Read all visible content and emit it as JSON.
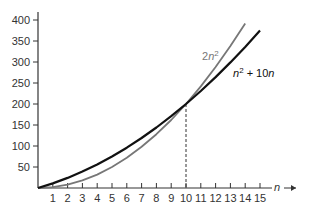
{
  "chart_data": {
    "type": "line",
    "title": "",
    "xlabel": "n",
    "ylabel": "",
    "xlim": [
      0,
      15
    ],
    "ylim": [
      0,
      400
    ],
    "x_ticks": [
      1,
      2,
      3,
      4,
      5,
      6,
      7,
      8,
      9,
      10,
      11,
      12,
      13,
      14,
      15
    ],
    "y_ticks": [
      50,
      100,
      150,
      200,
      250,
      300,
      350,
      400
    ],
    "grid": false,
    "legend": null,
    "series": [
      {
        "name": "2n^2",
        "label": "2n",
        "sup": "2",
        "color": "#777777",
        "x": [
          0,
          1,
          2,
          3,
          4,
          5,
          6,
          7,
          8,
          9,
          10,
          11,
          12,
          13,
          14
        ],
        "values": [
          0,
          2,
          8,
          18,
          32,
          50,
          72,
          98,
          128,
          162,
          200,
          242,
          288,
          338,
          392
        ]
      },
      {
        "name": "n^2 + 10n",
        "label_a": "n",
        "sup": "2",
        "label_b": " + 10n",
        "color": "#111111",
        "x": [
          0,
          1,
          2,
          3,
          4,
          5,
          6,
          7,
          8,
          9,
          10,
          11,
          12,
          13,
          14,
          15
        ],
        "values": [
          0,
          11,
          24,
          39,
          56,
          75,
          96,
          119,
          144,
          171,
          200,
          231,
          264,
          299,
          336,
          375
        ]
      }
    ],
    "annotations": [
      {
        "type": "dashed-vertical",
        "x": 10,
        "y": 200,
        "note": "intersection of curves at n = 10"
      }
    ]
  }
}
